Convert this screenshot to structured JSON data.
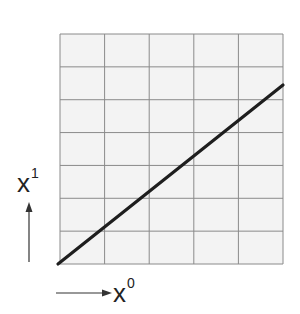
{
  "diagram": {
    "grid": {
      "columns": 5,
      "rows": 7,
      "left": 60,
      "top": 34,
      "right": 283,
      "bottom": 264,
      "fill": "#f3f3f3",
      "line_color": "#8a8a8a"
    },
    "line": {
      "from": [
        0,
        0
      ],
      "to": [
        5,
        5.45
      ],
      "color": "#1e1e1e",
      "width": 3.2
    },
    "axes": {
      "x": {
        "base": "x",
        "superscript": "0",
        "arrow": "right"
      },
      "y": {
        "base": "x",
        "superscript": "1",
        "arrow": "up"
      }
    },
    "arrow_color": "#333333"
  }
}
